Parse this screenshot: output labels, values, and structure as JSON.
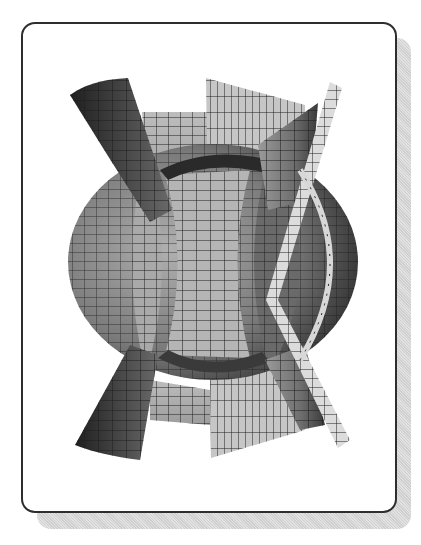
{
  "figure": {
    "frame": {
      "style": "rounded rectangle with drop shadow"
    },
    "colors": {
      "background": "#ffffff",
      "frame_border": "#2e2e2e",
      "shadow": "#d8d8d8",
      "surface_dark": "#3a3a3a",
      "surface_mid": "#7a7a7a",
      "surface_light": "#b8b8b8",
      "surface_lightest": "#d6d6d6",
      "grid_line": "#1e1e1e"
    },
    "surfaces": [
      {
        "name": "sphere",
        "shade": "mid"
      },
      {
        "name": "left-hyperbolic-sheet",
        "shade": "dark"
      },
      {
        "name": "right-hyperbolic-sheet",
        "shade": "mid"
      },
      {
        "name": "vertical-plane-center",
        "shade": "light"
      },
      {
        "name": "thin-slanted-strip",
        "shade": "lightest"
      }
    ]
  }
}
